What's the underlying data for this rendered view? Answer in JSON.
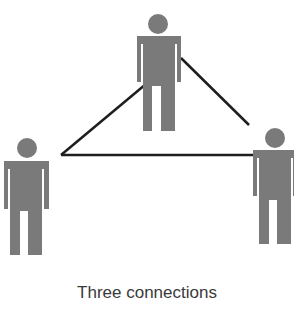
{
  "caption": "Three connections",
  "colors": {
    "figure": "#7a7a7a",
    "line": "#1e1e1e",
    "text": "#3a3a3a"
  },
  "figures": [
    {
      "id": "top",
      "head": {
        "cx": 158,
        "cy": 24,
        "r": 10
      }
    },
    {
      "id": "left",
      "head": {
        "cx": 27,
        "cy": 148,
        "r": 10
      }
    },
    {
      "id": "right",
      "head": {
        "cx": 275,
        "cy": 138,
        "r": 10
      }
    }
  ],
  "connections": [
    {
      "from": "left",
      "to": "top"
    },
    {
      "from": "top",
      "to": "right"
    },
    {
      "from": "left",
      "to": "right"
    }
  ]
}
